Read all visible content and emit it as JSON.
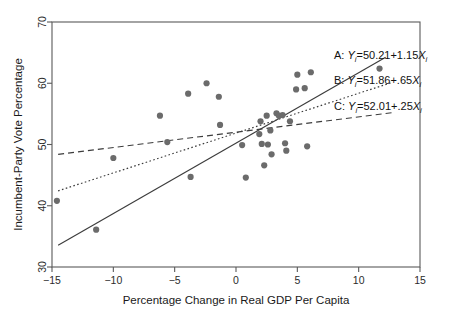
{
  "chart_data": {
    "type": "scatter",
    "title": "",
    "xlabel": "Percentage Change in Real GDP Per Capita",
    "ylabel": "Incumbent-Party Vote Percentage",
    "xlim": [
      -15,
      15
    ],
    "ylim": [
      30,
      70
    ],
    "xticks": [
      -15,
      -10,
      -5,
      0,
      5,
      10,
      15
    ],
    "yticks": [
      30,
      40,
      50,
      60,
      70
    ],
    "xtick_labels": [
      "−15",
      "−10",
      "−5",
      "0",
      "5",
      "10",
      "15"
    ],
    "ytick_labels": [
      "30",
      "40",
      "50",
      "60",
      "70"
    ],
    "grid": false,
    "legend_position": "inside-right",
    "marker_color": "#6b6b6b",
    "line_color": "#3c3c3c",
    "axis_color": "#5a5a5a",
    "points": [
      {
        "x": -14.6,
        "y": 40.8
      },
      {
        "x": -11.4,
        "y": 36.1
      },
      {
        "x": -10.0,
        "y": 47.8
      },
      {
        "x": -6.2,
        "y": 54.7
      },
      {
        "x": -5.6,
        "y": 50.4
      },
      {
        "x": -3.9,
        "y": 58.3
      },
      {
        "x": -3.7,
        "y": 44.7
      },
      {
        "x": -2.4,
        "y": 60.0
      },
      {
        "x": -1.4,
        "y": 57.8
      },
      {
        "x": -1.3,
        "y": 53.2
      },
      {
        "x": 0.5,
        "y": 49.9
      },
      {
        "x": 0.8,
        "y": 44.6
      },
      {
        "x": 1.9,
        "y": 51.7
      },
      {
        "x": 2.0,
        "y": 53.8
      },
      {
        "x": 2.1,
        "y": 50.1
      },
      {
        "x": 2.3,
        "y": 46.6
      },
      {
        "x": 2.5,
        "y": 54.7
      },
      {
        "x": 2.6,
        "y": 50.0
      },
      {
        "x": 2.8,
        "y": 52.3
      },
      {
        "x": 2.9,
        "y": 48.4
      },
      {
        "x": 3.3,
        "y": 55.1
      },
      {
        "x": 3.5,
        "y": 54.7
      },
      {
        "x": 3.8,
        "y": 54.8
      },
      {
        "x": 4.0,
        "y": 50.2
      },
      {
        "x": 4.1,
        "y": 49.0
      },
      {
        "x": 4.4,
        "y": 53.8
      },
      {
        "x": 4.9,
        "y": 59.0
      },
      {
        "x": 5.0,
        "y": 61.4
      },
      {
        "x": 5.6,
        "y": 59.2
      },
      {
        "x": 5.8,
        "y": 49.7
      },
      {
        "x": 6.1,
        "y": 61.8
      },
      {
        "x": 11.7,
        "y": 62.4
      }
    ],
    "lines": [
      {
        "id": "A",
        "label": "A:",
        "style": "solid",
        "intercept": 50.21,
        "slope": 1.15,
        "x_start": -14.5,
        "x_end": 12.2,
        "equation_parts": {
          "prefix": "A:",
          "response": "Y",
          "sub": "i",
          "body": "=50.21+1.15",
          "predictor": "X",
          "predictor_sub": "i"
        }
      },
      {
        "id": "B",
        "label": "B:",
        "style": "dotted",
        "intercept": 51.86,
        "slope": 0.65,
        "x_start": -14.5,
        "x_end": 12.6,
        "equation_parts": {
          "prefix": "B:",
          "response": "Y",
          "sub": "i",
          "body": "=51.86+.65",
          "predictor": "X",
          "predictor_sub": "i"
        }
      },
      {
        "id": "C",
        "label": "C:",
        "style": "dashed",
        "intercept": 52.01,
        "slope": 0.25,
        "x_start": -14.5,
        "x_end": 13.0,
        "equation_parts": {
          "prefix": "C:",
          "response": "Y",
          "sub": "i",
          "body": "=52.01+.25",
          "predictor": "X",
          "predictor_sub": "i"
        }
      }
    ]
  }
}
